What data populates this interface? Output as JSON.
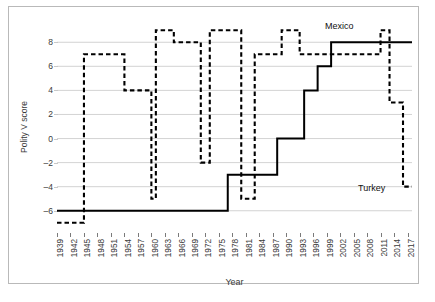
{
  "chart_data": {
    "type": "line",
    "title": "",
    "xlabel": "Year",
    "ylabel": "Polity V score",
    "xlim": [
      1939,
      2018
    ],
    "ylim": [
      -7.6,
      9.6
    ],
    "grid": "horizontal",
    "legend_position": "inline-annotations",
    "y_ticks": [
      8,
      6,
      4,
      2,
      0,
      -2,
      -4,
      -6
    ],
    "x_ticks": [
      1939,
      1942,
      1945,
      1948,
      1951,
      1954,
      1957,
      1960,
      1963,
      1966,
      1969,
      1972,
      1975,
      1978,
      1981,
      1984,
      1987,
      1990,
      1993,
      1996,
      1999,
      2002,
      2005,
      2008,
      2011,
      2014,
      2017
    ],
    "series": [
      {
        "name": "Mexico",
        "style": "solid",
        "color": "#000000",
        "annotation": "Mexico",
        "steps": [
          [
            1939,
            -6
          ],
          [
            1977,
            -6
          ],
          [
            1977,
            -3
          ],
          [
            1988,
            -3
          ],
          [
            1988,
            0
          ],
          [
            1994,
            0
          ],
          [
            1994,
            4
          ],
          [
            1997,
            4
          ],
          [
            1997,
            6
          ],
          [
            2000,
            6
          ],
          [
            2000,
            8
          ],
          [
            2018,
            8
          ]
        ]
      },
      {
        "name": "Turkey",
        "style": "dashed",
        "color": "#000000",
        "annotation": "Turkey",
        "steps": [
          [
            1939,
            -7
          ],
          [
            1945,
            -7
          ],
          [
            1945,
            7
          ],
          [
            1954,
            7
          ],
          [
            1954,
            4
          ],
          [
            1960,
            4
          ],
          [
            1960,
            -5
          ],
          [
            1961,
            -5
          ],
          [
            1961,
            9
          ],
          [
            1965,
            9
          ],
          [
            1965,
            8
          ],
          [
            1971,
            8
          ],
          [
            1971,
            -2
          ],
          [
            1973,
            -2
          ],
          [
            1973,
            9
          ],
          [
            1980,
            9
          ],
          [
            1980,
            -5
          ],
          [
            1983,
            -5
          ],
          [
            1983,
            7
          ],
          [
            1989,
            7
          ],
          [
            1989,
            9
          ],
          [
            1993,
            9
          ],
          [
            1993,
            7
          ],
          [
            2011,
            7
          ],
          [
            2011,
            9
          ],
          [
            2013,
            9
          ],
          [
            2013,
            3
          ],
          [
            2016,
            3
          ],
          [
            2016,
            -4
          ],
          [
            2018,
            -4
          ]
        ]
      }
    ]
  },
  "axes": {
    "y_title": "Polity V score",
    "x_title": "Year",
    "y_tick_labels": [
      "8",
      "6",
      "4",
      "2",
      "0",
      "–2",
      "–4",
      "–6"
    ],
    "x_tick_labels": [
      "1939",
      "1942",
      "1945",
      "1948",
      "1951",
      "1954",
      "1957",
      "1960",
      "1963",
      "1966",
      "1969",
      "1972",
      "1975",
      "1978",
      "1981",
      "1984",
      "1987",
      "1990",
      "1993",
      "1996",
      "1999",
      "2002",
      "2005",
      "2008",
      "2011",
      "2014",
      "2017"
    ]
  },
  "annotations": {
    "mexico": "Mexico",
    "turkey": "Turkey"
  },
  "colors": {
    "line": "#000000",
    "grid": "#c8c8c8",
    "border": "#b9b9b9",
    "text": "#3a3a3a",
    "background": "#ffffff"
  }
}
